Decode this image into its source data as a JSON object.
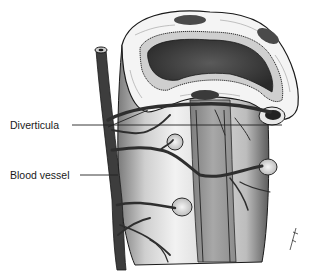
{
  "diagram": {
    "labels": [
      {
        "id": "diverticula",
        "text": "Diverticula"
      },
      {
        "id": "blood-vessel",
        "text": "Blood vessel"
      }
    ],
    "colors": {
      "background": "#ffffff",
      "outline": "#1a1a1a",
      "wall": "#e6e6e6",
      "shade": "#8a8a8a",
      "lumen": "#3a3a3a",
      "vessel": "#3d3d3d",
      "leader_line": "#222222"
    }
  }
}
